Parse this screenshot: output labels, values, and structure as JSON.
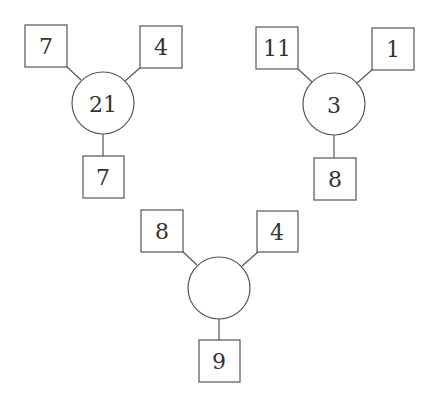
{
  "diagrams": [
    {
      "top_left": "7",
      "top_right": "4",
      "center": "21",
      "bottom": "7"
    },
    {
      "top_left": "11",
      "top_right": "1",
      "center": "3",
      "bottom": "8"
    },
    {
      "top_left": "8",
      "top_right": "4",
      "center": "",
      "bottom": "9"
    }
  ]
}
